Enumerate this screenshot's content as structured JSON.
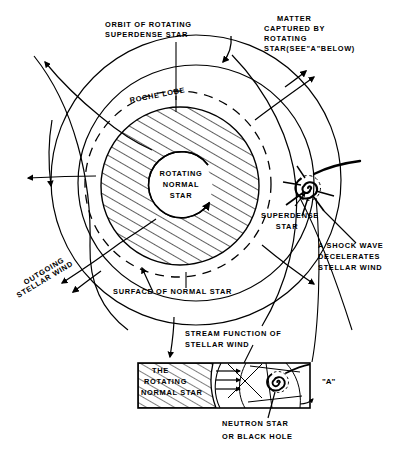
{
  "figure": {
    "width": 419,
    "height": 457,
    "ink_color": "#000000",
    "background_color": "#ffffff"
  },
  "labels": {
    "orbit_line1": "ORBIT OF ROTATING",
    "orbit_line2": "SUPERDENSE STAR",
    "matter_line1": "MATTER",
    "matter_line2": "CAPTURED BY",
    "matter_line3": "ROTATING",
    "matter_line4": "STAR(SEE\"A\"BELOW)",
    "roche_lobe": "ROCHE LOBE",
    "rotating_normal_star_line1": "ROTATING",
    "rotating_normal_star_line2": "NORMAL",
    "rotating_normal_star_line3": "STAR",
    "superdense_star_line1": "SUPERDENSE",
    "superdense_star_line2": "STAR",
    "shock_line1": "A SHOCK WAVE",
    "shock_line2": "DECELERATES",
    "shock_line3": "STELLAR WIND",
    "outgoing_line1": "OUTGOING",
    "outgoing_line2": "STELLAR WIND",
    "surface_of_normal_star": "SURFACE OF NORMAL STAR",
    "stream_line1": "STREAM FUNCTION OF",
    "stream_line2": "STELLAR WIND",
    "inset_star_line1": "THE",
    "inset_star_line2": "ROTATING",
    "inset_star_line3": "NORMAL STAR",
    "inset_tag": "\"A\"",
    "neutron_line1": "NEUTRON STAR",
    "neutron_line2": "OR BLACK HOLE"
  },
  "geometry": {
    "orbit_circle": {
      "cx": 196,
      "cy": 180,
      "r": 145
    },
    "wind_circle": {
      "cx": 196,
      "cy": 183,
      "r": 118
    },
    "roche_lobe_ellipse": {
      "cx": 178,
      "cy": 184,
      "rx": 93,
      "ry": 93
    },
    "normal_star_disk": {
      "cx": 180,
      "cy": 186,
      "r": 79
    },
    "rotation_circle": {
      "cx": 181,
      "cy": 186,
      "r": 33
    },
    "superdense_star": {
      "cx": 308,
      "cy": 188,
      "r": 13
    },
    "inset_box": {
      "x": 138,
      "y": 363,
      "width": 172,
      "height": 45
    },
    "inset_spiral": {
      "cx": 278,
      "cy": 382,
      "r": 11
    },
    "hatch_angle_deg": 60
  }
}
